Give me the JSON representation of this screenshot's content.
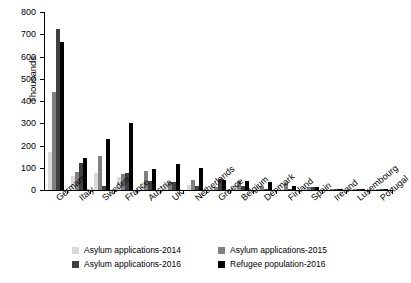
{
  "chart_data": {
    "type": "bar",
    "title": "",
    "xlabel": "",
    "ylabel": "Thousands",
    "ylim": [
      0,
      800
    ],
    "ytick_step": 100,
    "yticks": [
      "0",
      "100",
      "200",
      "300",
      "400",
      "500",
      "600",
      "700",
      "800"
    ],
    "grid": false,
    "legend_position": "bottom",
    "categories": [
      "Germany",
      "Italy",
      "Sweden",
      "France",
      "Austria",
      "UK",
      "Netherlands",
      "Greece",
      "Belgium",
      "Denmark",
      "Finland",
      "Spain",
      "Ireland",
      "Luxembourg",
      "Portugal"
    ],
    "series": [
      {
        "name": "Asylum applications-2014",
        "color": "#d9d9d9",
        "values": [
          173,
          63,
          75,
          57,
          28,
          33,
          24,
          9,
          22,
          14,
          3,
          5,
          1,
          1,
          0
        ]
      },
      {
        "name": "Asylum applications-2015",
        "color": "#808080",
        "values": [
          442,
          83,
          153,
          72,
          85,
          38,
          43,
          13,
          39,
          20,
          32,
          14,
          3,
          2,
          1
        ]
      },
      {
        "name": "Asylum applications-2016",
        "color": "#404040",
        "values": [
          722,
          120,
          20,
          75,
          40,
          37,
          19,
          49,
          17,
          6,
          5,
          15,
          2,
          2,
          1
        ]
      },
      {
        "name": "Refugee population-2016",
        "color": "#000000",
        "values": [
          666,
          143,
          228,
          300,
          93,
          118,
          101,
          46,
          42,
          36,
          20,
          12,
          6,
          1,
          1
        ]
      }
    ]
  },
  "legend": {
    "items": [
      {
        "label": "Asylum applications-2014",
        "color": "#d9d9d9"
      },
      {
        "label": "Asylum applications-2015",
        "color": "#808080"
      },
      {
        "label": "Asylum applications-2016",
        "color": "#404040"
      },
      {
        "label": "Refugee population-2016",
        "color": "#000000"
      }
    ]
  }
}
